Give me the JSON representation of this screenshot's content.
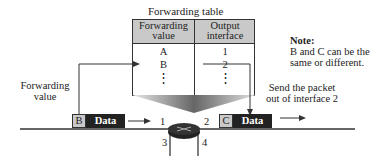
{
  "table": {
    "title": "Forwarding table",
    "headers": [
      "Forwarding value",
      "Output interface"
    ],
    "header_lines": [
      [
        "Forwarding",
        "value"
      ],
      [
        "Output",
        "interface"
      ]
    ],
    "rows": [
      [
        "A",
        "1"
      ],
      [
        "B",
        "2"
      ]
    ],
    "ellipsis": "⋮"
  },
  "left_label": [
    "Forwarding",
    "value"
  ],
  "right_label": [
    "Send the packet",
    "out of interface 2"
  ],
  "note": {
    "title": "Note:",
    "lines": [
      "B and C can be the",
      "same or different."
    ]
  },
  "incoming_packet": {
    "address": "B",
    "data": "Data"
  },
  "outgoing_packet": {
    "address": "C",
    "data": "Data"
  },
  "router_interfaces": [
    "1",
    "2",
    "3",
    "4"
  ],
  "colors": {
    "header_fill": "#c9c9c9",
    "data_fill": "#222222",
    "funnel_dark": "#555555",
    "funnel_light": "#dddddd"
  }
}
